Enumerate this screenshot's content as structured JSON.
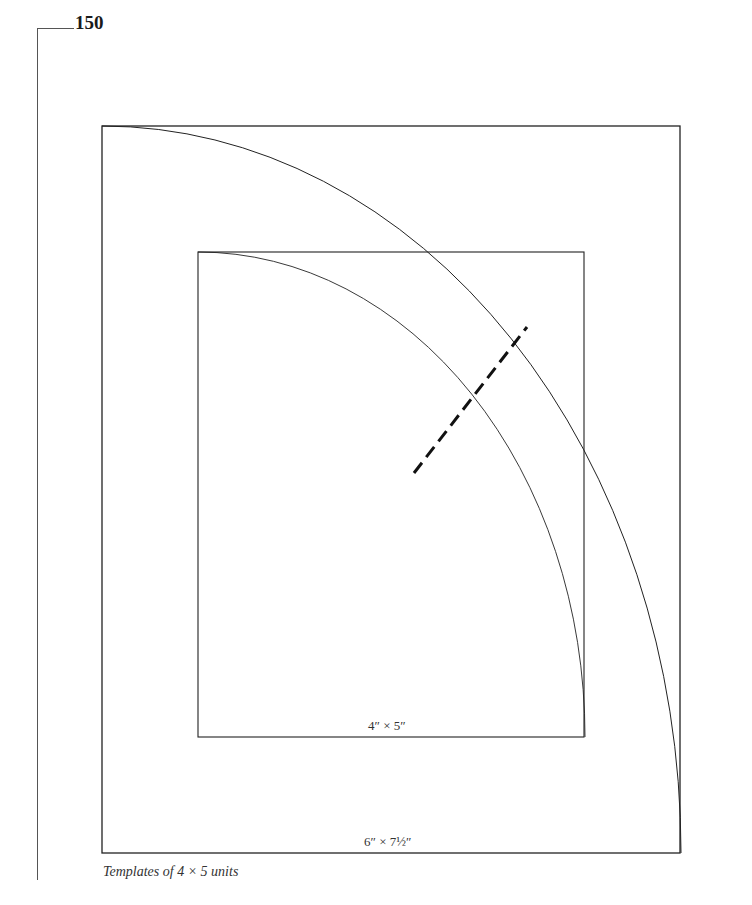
{
  "page": {
    "number": "150",
    "caption": "Templates of 4 × 5 units"
  },
  "figure": {
    "outer_rect": {
      "label": "6″ × 7½″",
      "x": 102,
      "y": 126,
      "width": 578,
      "height": 727
    },
    "inner_rect": {
      "label": "4″ × 5″",
      "x": 198,
      "y": 252,
      "width": 386,
      "height": 485
    },
    "outer_arc": {
      "from": [
        102,
        126
      ],
      "to": [
        681,
        853
      ]
    },
    "inner_arc": {
      "from": [
        198,
        252
      ],
      "to": [
        585,
        737
      ]
    },
    "cut_line": {
      "style": "dashed",
      "from": [
        414,
        473
      ],
      "to": [
        527,
        327
      ]
    }
  },
  "colors": {
    "line": "#222222",
    "dash": "#111111",
    "margin_rule": "#555555"
  }
}
